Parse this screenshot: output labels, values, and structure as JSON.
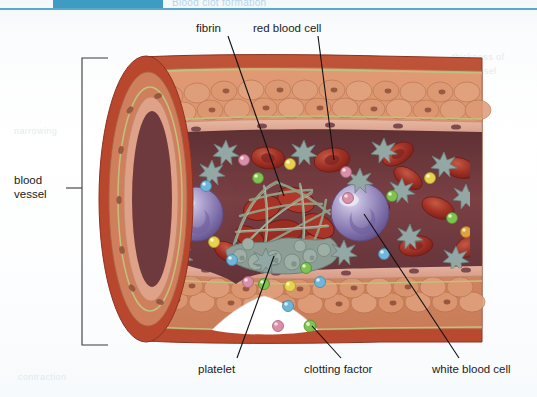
{
  "header": {
    "title": "Blood clot formation",
    "accent_color": "#3d9bc4",
    "rule_color": "#5aa8cc"
  },
  "figure": {
    "type": "biology-illustration",
    "background_color": "#ffffff"
  },
  "labels": [
    {
      "id": "fibrin",
      "text": "fibrin",
      "position": "top-left"
    },
    {
      "id": "red_blood_cell",
      "text": "red blood cell",
      "position": "top-right"
    },
    {
      "id": "blood_vessel",
      "text": "blood vessel",
      "position": "left",
      "line1": "blood",
      "line2": "vessel"
    },
    {
      "id": "platelet",
      "text": "platelet",
      "position": "bottom-left"
    },
    {
      "id": "clotting_factor",
      "text": "clotting factor",
      "position": "bottom-center"
    },
    {
      "id": "white_blood_cell",
      "text": "white blood cell",
      "position": "bottom-right"
    }
  ],
  "structures": {
    "vessel_wall_outer_color": "#b8472e",
    "vessel_wall_muscle_color": "#d88c6a",
    "endothelium_color": "#e3a893",
    "basement_membrane_color": "#b9b878",
    "lumen_color": "#6e3a3e",
    "red_blood_cell_color": "#a33226",
    "white_blood_cell_color": "#8a7fb5",
    "platelet_color": "#8fa3a0",
    "fibrin_color": "#9aa894",
    "clotting_factor_colors": [
      "#e8d24a",
      "#7ec34f",
      "#6fb6d8",
      "#d98fa8",
      "#e0a23f"
    ]
  },
  "leader_lines": {
    "count": 6,
    "color": "#111111"
  }
}
